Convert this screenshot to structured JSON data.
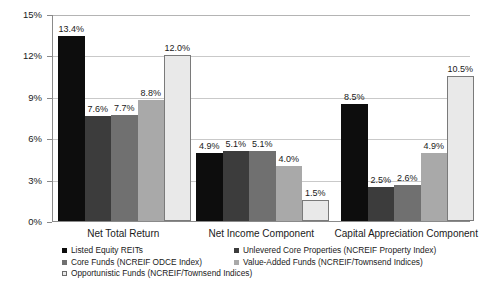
{
  "chart_data": {
    "type": "bar",
    "title": "",
    "xlabel": "",
    "ylabel": "",
    "ylim": [
      0,
      15
    ],
    "ytick_values": [
      0,
      3,
      6,
      9,
      12,
      15
    ],
    "ytick_labels": [
      "0%",
      "3%",
      "6%",
      "9%",
      "12%",
      "15%"
    ],
    "grid": true,
    "legend_position": "bottom",
    "categories": [
      "Net Total Return",
      "Net Income Component",
      "Capital Appreciation Component"
    ],
    "series": [
      {
        "name": "Listed Equity REITs",
        "color": "#0d0d0d",
        "values": [
          13.4,
          4.9,
          8.5
        ],
        "labels": [
          "13.4%",
          "4.9%",
          "8.5%"
        ]
      },
      {
        "name": "Unlevered Core Properties (NCREIF Property Index)",
        "color": "#3c3c3c",
        "values": [
          7.6,
          5.1,
          2.5
        ],
        "labels": [
          "7.6%",
          "5.1%",
          "2.5%"
        ]
      },
      {
        "name": "Core Funds (NCREIF ODCE Index)",
        "color": "#707070",
        "values": [
          7.7,
          5.1,
          2.6
        ],
        "labels": [
          "7.7%",
          "5.1%",
          "2.6%"
        ]
      },
      {
        "name": "Value-Added Funds (NCREIF/Townsend Indices)",
        "color": "#a9a9a9",
        "values": [
          8.8,
          4.0,
          4.9
        ],
        "labels": [
          "8.8%",
          "4.0%",
          "4.9%"
        ]
      },
      {
        "name": "Opportunistic Funds (NCREIF/Townsend Indices)",
        "color": "#e9e9e9",
        "values": [
          12.0,
          1.5,
          10.5
        ],
        "labels": [
          "12.0%",
          "1.5%",
          "10.5%"
        ]
      }
    ]
  },
  "legend": {
    "left_column": [
      {
        "label": "Listed Equity REITs",
        "color": "#0d0d0d"
      },
      {
        "label": "Core Funds (NCREIF ODCE Index)",
        "color": "#707070"
      },
      {
        "label": "Opportunistic Funds (NCREIF/Townsend Indices)",
        "color": "#e9e9e9"
      }
    ],
    "right_column": [
      {
        "label": "Unlevered Core Properties (NCREIF Property Index)",
        "color": "#3c3c3c"
      },
      {
        "label": "Value-Added Funds (NCREIF/Townsend Indices)",
        "color": "#a9a9a9"
      }
    ]
  }
}
